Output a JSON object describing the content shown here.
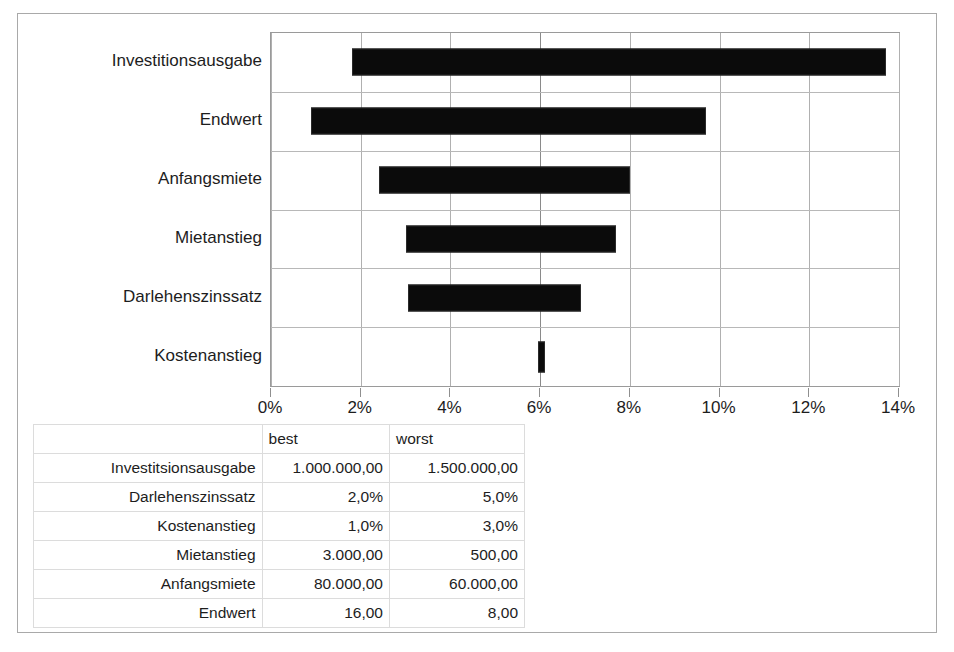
{
  "chart_data": {
    "type": "bar",
    "subtype": "tornado",
    "title": "",
    "xlabel": "",
    "ylabel": "",
    "xlim": [
      0,
      14
    ],
    "xunit": "%",
    "x_tick_labels": [
      "0%",
      "2%",
      "4%",
      "6%",
      "8%",
      "10%",
      "12%",
      "14%"
    ],
    "x_ticks": [
      0,
      2,
      4,
      6,
      8,
      10,
      12,
      14
    ],
    "grid": true,
    "legend": "none",
    "base_value": 6.0,
    "categories": [
      "Investitionsausgabe",
      "Endwert",
      "Anfangsmiete",
      "Mietanstieg",
      "Darlehenszinssatz",
      "Kostenanstieg"
    ],
    "bars": [
      {
        "label": "Investitionsausgabe",
        "low": 1.8,
        "high": 13.7
      },
      {
        "label": "Endwert",
        "low": 0.9,
        "high": 9.7
      },
      {
        "label": "Anfangsmiete",
        "low": 2.4,
        "high": 8.0
      },
      {
        "label": "Mietanstieg",
        "low": 3.0,
        "high": 7.7
      },
      {
        "label": "Darlehenszinssatz",
        "low": 3.05,
        "high": 6.9
      },
      {
        "label": "Kostenanstieg",
        "low": 5.95,
        "high": 6.1
      }
    ]
  },
  "table": {
    "name": "assumptions-table",
    "headers": {
      "name": "",
      "best": "best",
      "worst": "worst"
    },
    "rows": [
      {
        "name": "Investitsionsausgabe",
        "best": "1.000.000,00",
        "worst": "1.500.000,00"
      },
      {
        "name": "Darlehenszinssatz",
        "best": "2,0%",
        "worst": "5,0%"
      },
      {
        "name": "Kostenanstieg",
        "best": "1,0%",
        "worst": "3,0%"
      },
      {
        "name": "Mietanstieg",
        "best": "3.000,00",
        "worst": "500,00"
      },
      {
        "name": "Anfangsmiete",
        "best": "80.000,00",
        "worst": "60.000,00"
      },
      {
        "name": "Endwert",
        "best": "16,00",
        "worst": "8,00"
      }
    ]
  },
  "colors": {
    "bar": "#0b0b0b",
    "grid": "#b0b0b0",
    "axis": "#8f8f8f",
    "text": "#1d1d1d",
    "frame": "#a9a9a9",
    "background": "#ffffff"
  }
}
